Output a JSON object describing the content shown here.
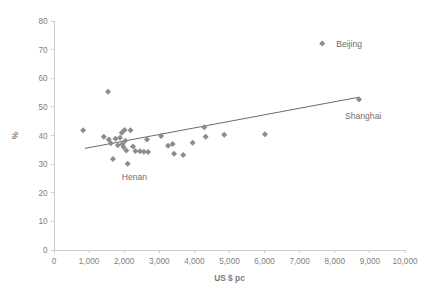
{
  "chart_data": {
    "type": "scatter",
    "title": "",
    "xlabel": "US $ pc",
    "ylabel": "%",
    "xlim": [
      0,
      10000
    ],
    "ylim": [
      0,
      80
    ],
    "grid": false,
    "legend": false,
    "xticks": [
      0,
      1000,
      2000,
      3000,
      4000,
      5000,
      6000,
      7000,
      8000,
      9000,
      10000
    ],
    "xtick_labels": [
      "0",
      "1,000",
      "2,000",
      "3,000",
      "4,000",
      "5,000",
      "6,000",
      "7,000",
      "8,000",
      "9,000",
      "10,000"
    ],
    "yticks": [
      0,
      10,
      20,
      30,
      40,
      50,
      60,
      70,
      80
    ],
    "ytick_labels": [
      "0",
      "10",
      "20",
      "30",
      "40",
      "50",
      "60",
      "70",
      "80"
    ],
    "marker": "diamond",
    "marker_color": "#8c8c8c",
    "points": [
      {
        "x": 830,
        "y": 41.8
      },
      {
        "x": 1420,
        "y": 39.6
      },
      {
        "x": 1540,
        "y": 55.3
      },
      {
        "x": 1560,
        "y": 38.6
      },
      {
        "x": 1620,
        "y": 37.3
      },
      {
        "x": 1680,
        "y": 31.8
      },
      {
        "x": 1750,
        "y": 38.9
      },
      {
        "x": 1820,
        "y": 36.6
      },
      {
        "x": 1880,
        "y": 39.2
      },
      {
        "x": 1930,
        "y": 41.0
      },
      {
        "x": 1950,
        "y": 37.0
      },
      {
        "x": 1980,
        "y": 36.0
      },
      {
        "x": 2010,
        "y": 41.9
      },
      {
        "x": 2030,
        "y": 38.2
      },
      {
        "x": 2060,
        "y": 34.8
      },
      {
        "x": 2100,
        "y": 30.1
      },
      {
        "x": 2180,
        "y": 41.8
      },
      {
        "x": 2250,
        "y": 36.2
      },
      {
        "x": 2320,
        "y": 34.6
      },
      {
        "x": 2450,
        "y": 34.5
      },
      {
        "x": 2560,
        "y": 34.3
      },
      {
        "x": 2650,
        "y": 38.6
      },
      {
        "x": 2680,
        "y": 34.2
      },
      {
        "x": 3050,
        "y": 39.8
      },
      {
        "x": 3250,
        "y": 36.4
      },
      {
        "x": 3380,
        "y": 37.0
      },
      {
        "x": 3420,
        "y": 33.6
      },
      {
        "x": 3680,
        "y": 33.2
      },
      {
        "x": 3950,
        "y": 37.5
      },
      {
        "x": 4280,
        "y": 42.9
      },
      {
        "x": 4320,
        "y": 39.6
      },
      {
        "x": 4850,
        "y": 40.3
      },
      {
        "x": 6010,
        "y": 40.4
      },
      {
        "x": 7640,
        "y": 72.1
      },
      {
        "x": 8690,
        "y": 52.6
      }
    ],
    "annotations": [
      {
        "label": "Beijing",
        "x": 7640,
        "y": 72.1
      },
      {
        "label": "Shanghai",
        "x": 8690,
        "y": 52.6
      },
      {
        "label": "Henan",
        "x": 2100,
        "y": 30.1
      }
    ],
    "trendline": {
      "type": "linear",
      "x_start": 880,
      "y_start": 35.5,
      "x_end": 8690,
      "y_end": 53.4,
      "color": "#5a5a5a"
    }
  },
  "colors": {
    "marker": "#8c8c8c",
    "axis": "#c8c8c8",
    "tick_text": "#808080",
    "annotation_text": "#6e6e6e",
    "trend": "#5a5a5a",
    "background": "#ffffff"
  }
}
